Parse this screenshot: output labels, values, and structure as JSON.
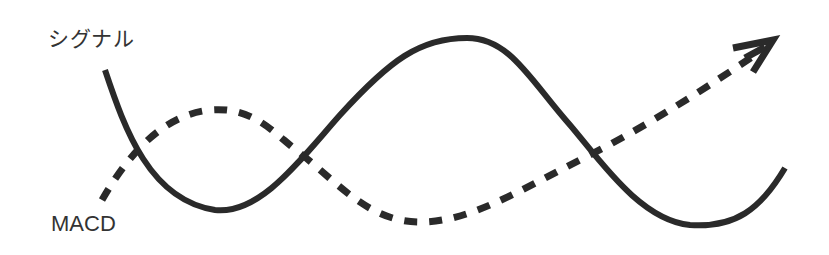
{
  "diagram": {
    "title": "",
    "labels": {
      "signal": "シグナル",
      "macd": "MACD"
    },
    "lines": [
      {
        "name": "シグナル",
        "style": "solid",
        "color": "#2a2a2a"
      },
      {
        "name": "MACD",
        "style": "dashed",
        "color": "#2a2a2a",
        "end_marker": "arrow"
      }
    ],
    "crossings": 3
  }
}
